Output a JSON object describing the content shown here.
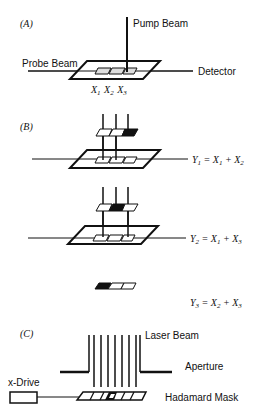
{
  "panels": {
    "A": {
      "label": "(A)",
      "pump_beam": "Pump Beam",
      "probe_beam": "Probe Beam",
      "detector": "Detector",
      "elements": [
        "X",
        "X",
        "X"
      ],
      "subscripts": [
        "1",
        "2",
        "3"
      ]
    },
    "B": {
      "label": "(B)",
      "equations": [
        {
          "lhs": "Y",
          "lhs_sub": "1",
          "eq": " = ",
          "t1": "X",
          "t1_sub": "1",
          "plus": " + ",
          "t2": "X",
          "t2_sub": "2"
        },
        {
          "lhs": "Y",
          "lhs_sub": "2",
          "eq": " = ",
          "t1": "X",
          "t1_sub": "1",
          "plus": " + ",
          "t2": "X",
          "t2_sub": "3"
        },
        {
          "lhs": "Y",
          "lhs_sub": "3",
          "eq": " = ",
          "t1": "X",
          "t1_sub": "2",
          "plus": " + ",
          "t2": "X",
          "t2_sub": "3"
        }
      ]
    },
    "C": {
      "label": "(C)",
      "laser_beam": "Laser Beam",
      "aperture": "Aperture",
      "x_drive": "x-Drive",
      "mask": "Hadamard Mask"
    }
  },
  "colors": {
    "ink": "#111111",
    "background": "#ffffff"
  }
}
